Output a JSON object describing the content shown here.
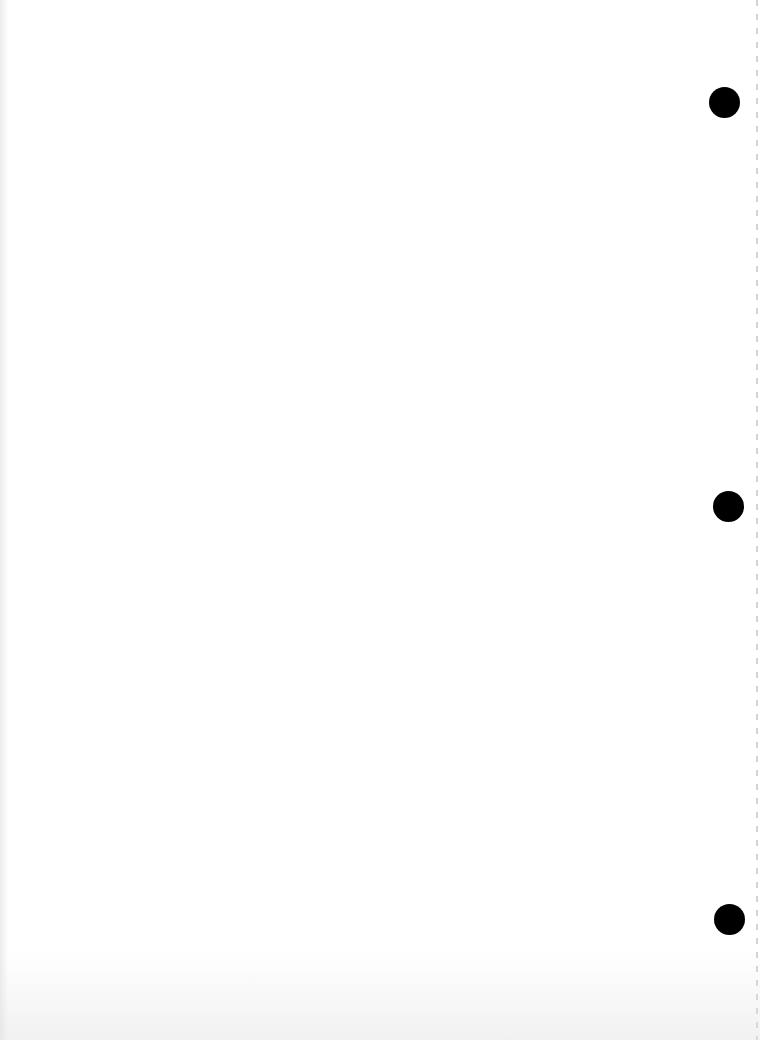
{
  "page": {
    "background_color": "#ffffff"
  },
  "punch_holes": [
    {
      "label": "top-hole",
      "x": 709,
      "y": 87,
      "diameter": 31,
      "color": "#000000"
    },
    {
      "label": "middle-hole",
      "x": 713,
      "y": 491,
      "diameter": 31,
      "color": "#000000"
    },
    {
      "label": "bottom-hole",
      "x": 714,
      "y": 904,
      "diameter": 31,
      "color": "#000000"
    }
  ]
}
